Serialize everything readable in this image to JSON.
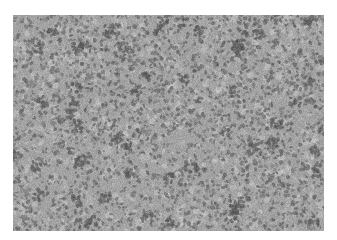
{
  "image": {
    "subject": "grayscale histology micrograph of densely packed cells",
    "background_color": "#ffffff",
    "tone": {
      "base_gray": "#a3a3a3",
      "dark_gray": "#5e5e5e",
      "light_gray": "#c8c8c8"
    }
  }
}
